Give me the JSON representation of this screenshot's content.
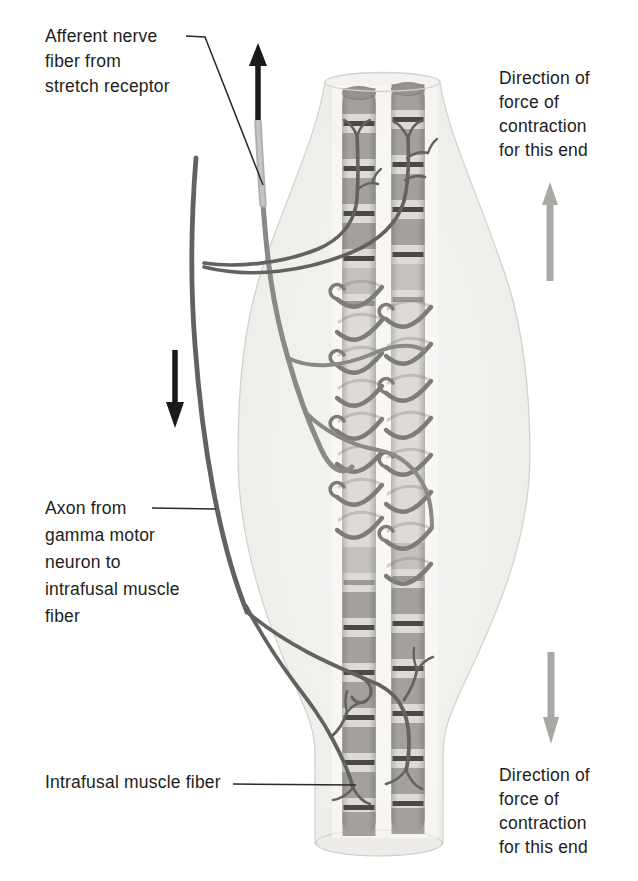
{
  "figure": {
    "labels": {
      "afferent": [
        "Afferent nerve",
        "fiber from",
        "stretch receptor"
      ],
      "gamma": [
        "Axon from",
        "gamma motor",
        "neuron to",
        "intrafusal muscle",
        "fiber"
      ],
      "intrafusal": [
        "Intrafusal muscle fiber"
      ],
      "direction_top": [
        "Direction of",
        "force of",
        "contraction",
        "for this end"
      ],
      "direction_bottom": [
        "Direction of",
        "force of",
        "contraction",
        "for this end"
      ]
    },
    "icons": {
      "afferent_direction": "black-up-arrow",
      "gamma_direction": "black-down-arrow",
      "contraction_top": "gray-up-arrow",
      "contraction_bottom": "gray-down-arrow"
    },
    "colors": {
      "background": "#ffffff",
      "text": "#1e1d1b",
      "capsule": "#efeeeb",
      "capsule_edge": "#cbc8c4",
      "fiber_base": "#dedbd7",
      "fiber_band": "#a4a19d",
      "fiber_stripe": "#3b3936",
      "fiber_cap": "#96938f",
      "spiral": "#7e7c79",
      "gamma_axon": "#636260",
      "afferent_fiber": "#b0aeab",
      "afferent_sheen": "#c7c5c2",
      "afferent_branch": "#8b8987",
      "arrow_black": "#1b1a19",
      "arrow_gray": "#aaa8a5",
      "leader_line": "#2a2928"
    }
  }
}
